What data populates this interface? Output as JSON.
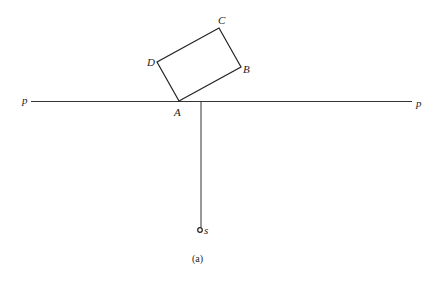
{
  "diagram": {
    "caption": "(a)",
    "line_label_left": "p",
    "line_label_right": "p",
    "point_s_label": "s",
    "rectangle": {
      "vertices": [
        {
          "label": "A",
          "x": 179,
          "y": 101
        },
        {
          "label": "B",
          "x": 241,
          "y": 67
        },
        {
          "label": "C",
          "x": 219,
          "y": 28
        },
        {
          "label": "D",
          "x": 157,
          "y": 62
        }
      ]
    },
    "line_p": {
      "x1": 31,
      "y1": 101,
      "x2": 412,
      "y2": 101
    },
    "vertical_line": {
      "x": 201,
      "y1": 101,
      "y2": 227
    },
    "point_s": {
      "x": 200,
      "y": 230
    },
    "colors": {
      "stroke": "#222222",
      "background": "#ffffff"
    }
  }
}
